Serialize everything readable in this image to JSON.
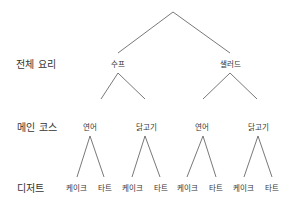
{
  "row_labels": {
    "level1": "전체 요리",
    "level2": "메인 코스",
    "level3": "디저트"
  },
  "tree": {
    "level1": [
      "수프",
      "샐러드"
    ],
    "level2": [
      "연어",
      "닭고기",
      "연어",
      "닭고기"
    ],
    "level3": [
      "케이크",
      "타트",
      "케이크",
      "타트",
      "케이크",
      "타트",
      "케이크",
      "타트"
    ]
  },
  "colors": {
    "line": "#555555",
    "text": "#333333",
    "background": "#ffffff"
  }
}
